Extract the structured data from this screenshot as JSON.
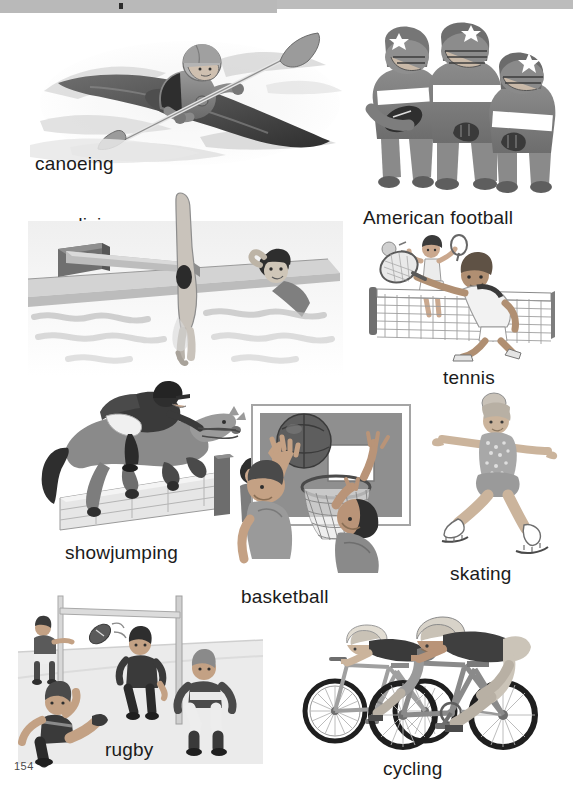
{
  "page": {
    "number": "154",
    "background_color": "#ffffff",
    "header_bar_color": "#b9b9b9",
    "ink_color": "#1b1b1b"
  },
  "entries": [
    {
      "id": "canoeing",
      "label": "canoeing",
      "illustration": "kayaker paddling through whitewater rapids",
      "label_position": {
        "x": 35,
        "y": 140
      },
      "figure_box": {
        "x": 30,
        "y": 25,
        "w": 320,
        "h": 150
      }
    },
    {
      "id": "american-football",
      "label": "American football",
      "illustration": "three american football players in helmets with star decals",
      "label_position": {
        "x": 363,
        "y": 194
      },
      "figure_box": {
        "x": 355,
        "y": 25,
        "w": 210,
        "h": 160
      }
    },
    {
      "id": "diving",
      "label": "diving",
      "illustration": "diver head-first off a springboard into a pool with a swimmer watching",
      "label_position": {
        "x": 72,
        "y": 204
      },
      "figure_box": {
        "x": 30,
        "y": 225,
        "w": 310,
        "h": 140
      }
    },
    {
      "id": "tennis",
      "label": "tennis",
      "illustration": "two tennis players at a net, one stretching for the ball with a racket",
      "label_position": {
        "x": 443,
        "y": 357
      },
      "figure_box": {
        "x": 355,
        "y": 230,
        "w": 215,
        "h": 120
      }
    },
    {
      "id": "showjumping",
      "label": "showjumping",
      "illustration": "rider on a horse jumping a brick wall obstacle",
      "label_position": {
        "x": 65,
        "y": 532
      },
      "figure_box": {
        "x": 40,
        "y": 390,
        "w": 220,
        "h": 140
      }
    },
    {
      "id": "basketball",
      "label": "basketball",
      "illustration": "two players reaching for a basketball at the hoop and backboard",
      "label_position": {
        "x": 241,
        "y": 576
      },
      "figure_box": {
        "x": 232,
        "y": 400,
        "w": 190,
        "h": 170
      }
    },
    {
      "id": "skating",
      "label": "skating",
      "illustration": "figure skater gliding with arms outstretched",
      "label_position": {
        "x": 450,
        "y": 553
      },
      "figure_box": {
        "x": 425,
        "y": 390,
        "w": 140,
        "h": 160
      }
    },
    {
      "id": "rugby",
      "label": "rugby",
      "illustration": "rugby player kicking a ball towards the goalposts with three others watching",
      "label_position": {
        "x": 105,
        "y": 729
      },
      "figure_box": {
        "x": 20,
        "y": 595,
        "w": 240,
        "h": 160
      }
    },
    {
      "id": "cycling",
      "label": "cycling",
      "illustration": "two racing cyclists in helmets riding bicycles",
      "label_position": {
        "x": 383,
        "y": 748
      },
      "figure_box": {
        "x": 295,
        "y": 615,
        "w": 250,
        "h": 130
      }
    }
  ]
}
